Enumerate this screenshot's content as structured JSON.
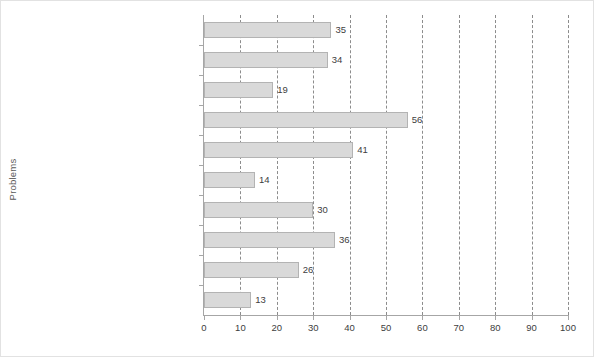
{
  "chart_data": {
    "type": "bar",
    "orientation": "horizontal",
    "title": "",
    "xlabel": "",
    "ylabel": "Problems",
    "xlim": [
      0,
      100
    ],
    "xticks": [
      0,
      10,
      20,
      30,
      40,
      50,
      60,
      70,
      80,
      90,
      100
    ],
    "grid": "vertical-dashed",
    "legend": null,
    "categories": [
      "customer complaints",
      "HR staff objections to structure",
      "poor learning within shared services",
      "boundary disputes",
      "gaps in service provision",
      "ineffective escalation procedures",
      "blocks to development of HR career",
      "HR communication difficulties",
      "expected savings not achieved",
      "none"
    ],
    "values": [
      35,
      34,
      19,
      56,
      41,
      14,
      30,
      36,
      26,
      13
    ],
    "data_labels": [
      "35",
      "34",
      "19",
      "56",
      "41",
      "14",
      "30",
      "36",
      "26",
      "13"
    ],
    "colors": {
      "bar_fill": "#d9d9d9",
      "bar_stroke": "#b3b3b3",
      "gridline": "#8c8c8c",
      "axis": "#a6a6a6",
      "text": "#595959",
      "background": "#ffffff"
    }
  }
}
